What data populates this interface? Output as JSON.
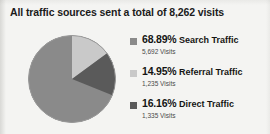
{
  "title": "All traffic sources sent a total of 8,262 visits",
  "colors": {
    "background": "#f4f4f2",
    "title_text": "#1b1b1b",
    "search_slice": "#8a8a8a",
    "referral_slice": "#c9c9c9",
    "direct_slice": "#5a5a5a",
    "pie_outline": "#8f8f8f"
  },
  "legend": {
    "items": [
      {
        "percent": "68.89%",
        "label": "Search Traffic",
        "visits": "5,692 Visits",
        "swatch_name": "search-traffic-swatch",
        "color": "#8a8a8a"
      },
      {
        "percent": "14.95%",
        "label": "Referral Traffic",
        "visits": "1,235 Visits",
        "swatch_name": "referral-traffic-swatch",
        "color": "#c9c9c9"
      },
      {
        "percent": "16.16%",
        "label": "Direct Traffic",
        "visits": "1,335 Visits",
        "swatch_name": "direct-traffic-swatch",
        "color": "#5a5a5a"
      }
    ]
  },
  "chart_data": {
    "type": "pie",
    "title": "All traffic sources sent a total of 8,262 visits",
    "total": 8262,
    "total_label": "8,262 visits",
    "categories": [
      "Search Traffic",
      "Referral Traffic",
      "Direct Traffic"
    ],
    "values": [
      5692,
      1235,
      1335
    ],
    "percentages": [
      68.89,
      14.95,
      16.16
    ],
    "colors": [
      "#8a8a8a",
      "#c9c9c9",
      "#5a5a5a"
    ],
    "legend_position": "right",
    "start_angle_deg": 0,
    "direction": "clockwise",
    "grid": false,
    "xlabel": "",
    "ylabel": ""
  }
}
